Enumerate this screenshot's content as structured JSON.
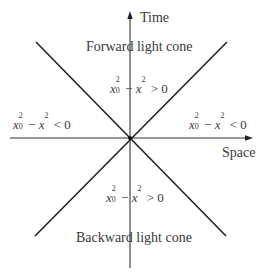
{
  "diagram": {
    "type": "spacetime-light-cone",
    "axes": {
      "vertical_label": "Time",
      "horizontal_label": "Space"
    },
    "regions": {
      "forward_cone_label": "Forward light cone",
      "backward_cone_label": "Backward light cone",
      "timelike_upper": {
        "var0": "x",
        "sub0": "0",
        "sup0": "2",
        "minus": "−",
        "var1": "x",
        "sup1": "2",
        "rel": "> 0"
      },
      "timelike_lower": {
        "var0": "x",
        "sub0": "0",
        "sup0": "2",
        "minus": "−",
        "var1": "x",
        "sup1": "2",
        "rel": "> 0"
      },
      "spacelike_left": {
        "var0": "x",
        "sub0": "0",
        "sup0": "2",
        "minus": "−",
        "var1": "x",
        "sup1": "2",
        "rel": "< 0"
      },
      "spacelike_right": {
        "var0": "x",
        "sub0": "0",
        "sup0": "2",
        "minus": "−",
        "var1": "x",
        "sup1": "2",
        "rel": "< 0"
      }
    },
    "colors": {
      "line": "#2a2a2a",
      "text": "#3a3a3a",
      "background": "#ffffff"
    }
  }
}
